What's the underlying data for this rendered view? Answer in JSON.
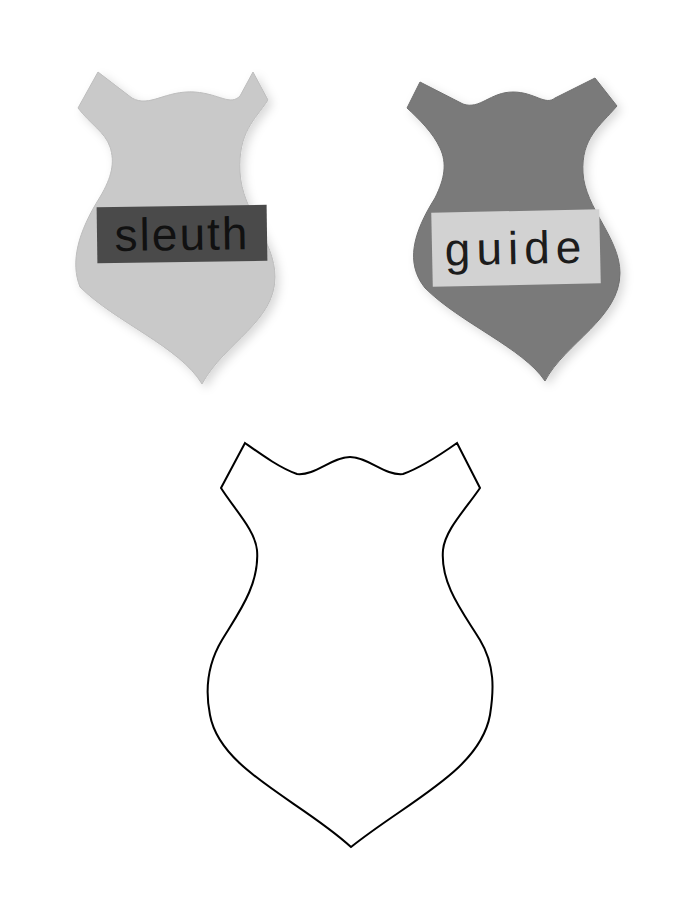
{
  "badges": [
    {
      "name": "sleuth",
      "label": "sleuth",
      "badge_color": "#c9c9c9",
      "label_bg": "#4a4a4a"
    },
    {
      "name": "guide",
      "label": "guide",
      "badge_color": "#7a7a7a",
      "label_bg": "#d2d2d2"
    }
  ],
  "template": {
    "shape": "shield-badge-outline",
    "stroke_color": "#000000",
    "fill_color": "#ffffff"
  },
  "colors": {
    "background": "#ffffff",
    "shadow": "rgba(0,0,0,0.12)"
  }
}
